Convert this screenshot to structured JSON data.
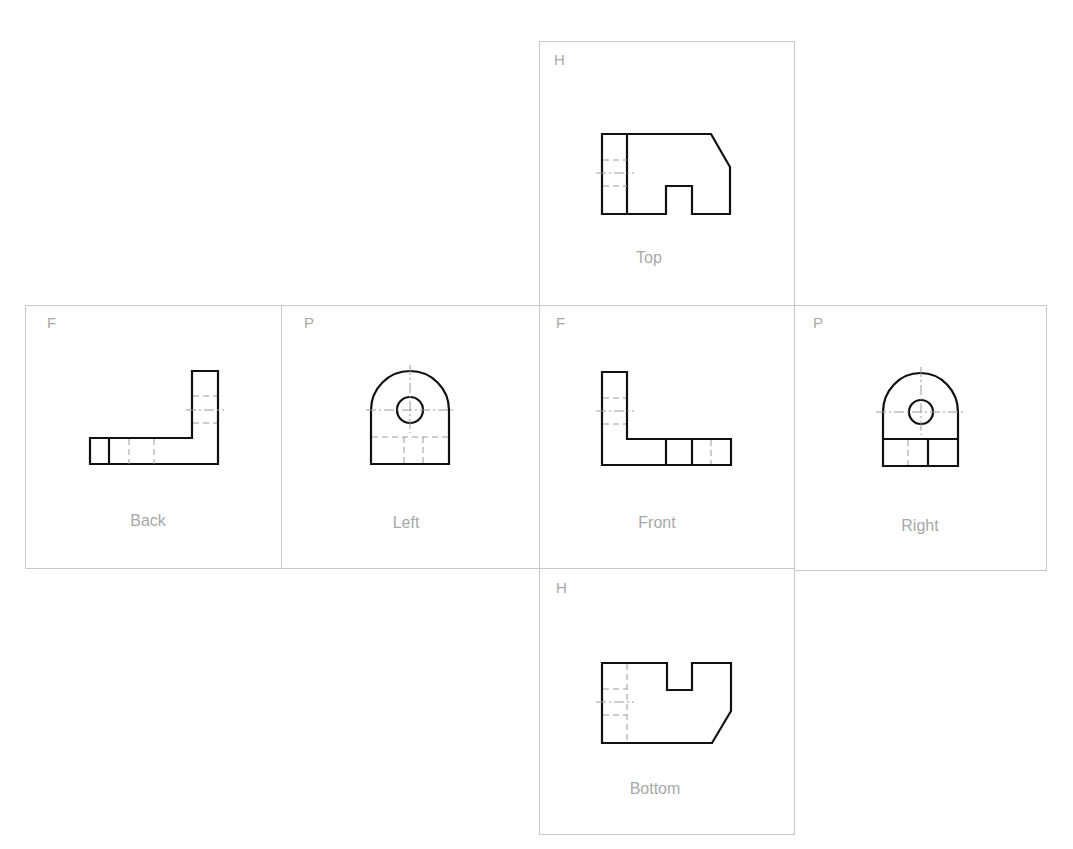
{
  "views": {
    "top": {
      "plane": "H",
      "label": "Top"
    },
    "back": {
      "plane": "F",
      "label": "Back"
    },
    "left": {
      "plane": "P",
      "label": "Left"
    },
    "front": {
      "plane": "F",
      "label": "Front"
    },
    "right": {
      "plane": "P",
      "label": "Right"
    },
    "bottom": {
      "plane": "H",
      "label": "Bottom"
    }
  },
  "colors": {
    "border": "#c8c8c8",
    "label": "#a8a8a8",
    "visible_line": "#111111",
    "hidden_line": "#9a9a9a"
  }
}
